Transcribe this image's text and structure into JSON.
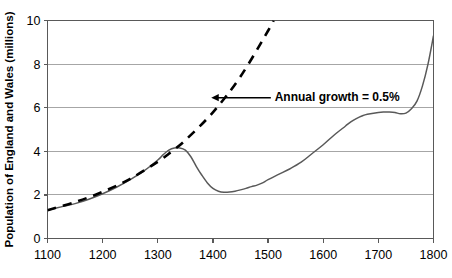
{
  "chart_data": {
    "type": "line",
    "title": "",
    "xlabel": "",
    "ylabel": "Population of England and Wales (millions)",
    "xlim": [
      1100,
      1800
    ],
    "ylim": [
      0,
      10
    ],
    "xticks": [
      1100,
      1200,
      1300,
      1400,
      1500,
      1600,
      1700,
      1800
    ],
    "yticks": [
      0,
      2,
      4,
      6,
      8,
      10
    ],
    "xtick_labels": [
      "1100",
      "1200",
      "1300",
      "1400",
      "1500",
      "1600",
      "1700",
      "1800"
    ],
    "ytick_labels": [
      "0",
      "2",
      "4",
      "6",
      "8",
      "10"
    ],
    "grid": "horizontal",
    "legend": "none",
    "series": [
      {
        "name": "Actual population",
        "style": "solid",
        "color": "#595959",
        "x": [
          1100,
          1125,
          1150,
          1175,
          1200,
          1225,
          1250,
          1275,
          1300,
          1310,
          1320,
          1330,
          1340,
          1350,
          1360,
          1370,
          1380,
          1390,
          1400,
          1410,
          1420,
          1430,
          1440,
          1450,
          1460,
          1470,
          1480,
          1490,
          1500,
          1520,
          1540,
          1560,
          1580,
          1600,
          1620,
          1640,
          1650,
          1660,
          1670,
          1680,
          1700,
          1710,
          1720,
          1730,
          1740,
          1750,
          1760,
          1770,
          1780,
          1790,
          1800
        ],
        "y": [
          1.3,
          1.45,
          1.6,
          1.8,
          2.05,
          2.35,
          2.7,
          3.1,
          3.6,
          3.85,
          4.05,
          4.15,
          4.15,
          4.05,
          3.75,
          3.3,
          2.9,
          2.55,
          2.3,
          2.17,
          2.12,
          2.13,
          2.17,
          2.23,
          2.3,
          2.38,
          2.45,
          2.55,
          2.7,
          2.95,
          3.2,
          3.5,
          3.9,
          4.3,
          4.75,
          5.15,
          5.35,
          5.5,
          5.62,
          5.7,
          5.78,
          5.8,
          5.8,
          5.78,
          5.72,
          5.75,
          5.95,
          6.3,
          7.0,
          8.0,
          9.3
        ]
      },
      {
        "name": "Annual growth = 0.5% trend",
        "style": "dashed",
        "color": "#000000",
        "x": [
          1100,
          1150,
          1200,
          1250,
          1300,
          1320,
          1350,
          1400,
          1450,
          1500,
          1510
        ],
        "y": [
          1.3,
          1.67,
          2.14,
          2.74,
          3.52,
          3.89,
          4.51,
          5.79,
          7.43,
          9.53,
          10.0
        ]
      }
    ],
    "annotations": [
      {
        "text": "Annual growth = 0.5%",
        "arrow": "left",
        "arrow_tip_x": 1397,
        "arrow_tip_y": 6.46,
        "arrow_tail_x": 1505,
        "arrow_tail_y": 6.46,
        "text_x": 1512,
        "text_y": 6.46
      }
    ]
  },
  "colors": {
    "solid_line": "#595959",
    "dashed_line": "#000000",
    "gridline": "#a6a6a6",
    "axis": "#595959",
    "text": "#000000",
    "background": "#ffffff"
  }
}
